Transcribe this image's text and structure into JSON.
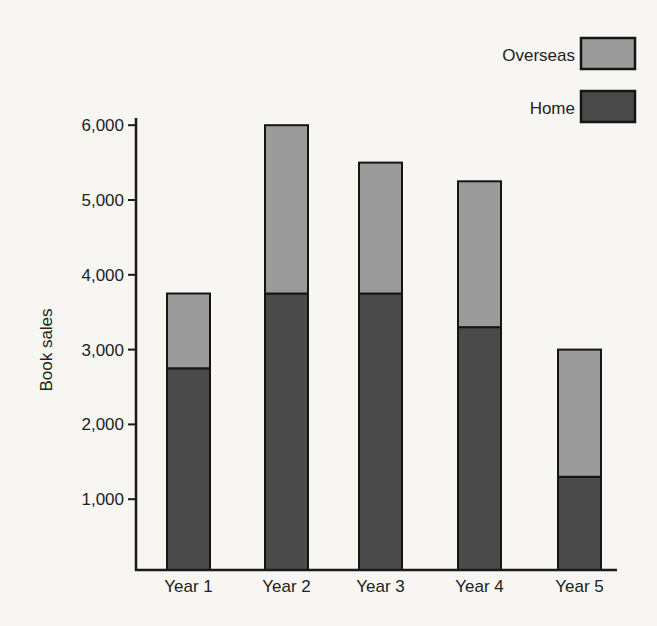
{
  "chart_data": {
    "type": "bar",
    "stacked": true,
    "title": "",
    "xlabel": "",
    "ylabel": "Book sales",
    "ylim": [
      0,
      6000
    ],
    "yticks": [
      1000,
      2000,
      3000,
      4000,
      5000,
      6000
    ],
    "ytick_labels": [
      "1,000",
      "2,000",
      "3,000",
      "4,000",
      "5,000",
      "6,000"
    ],
    "grid": false,
    "legend_position": "top-right",
    "categories": [
      "Year 1",
      "Year 2",
      "Year 3",
      "Year 4",
      "Year 5"
    ],
    "series": [
      {
        "name": "Home",
        "color": "#4a4a4a",
        "values": [
          2750,
          3750,
          3750,
          3300,
          1300
        ]
      },
      {
        "name": "Overseas",
        "color": "#9b9b9b",
        "values": [
          1000,
          2250,
          1750,
          1950,
          1700
        ]
      }
    ],
    "totals": [
      3750,
      6000,
      5500,
      5250,
      3000
    ]
  },
  "legend": {
    "items": [
      {
        "label": "Overseas",
        "color": "#9b9b9b"
      },
      {
        "label": "Home",
        "color": "#4a4a4a"
      }
    ]
  }
}
